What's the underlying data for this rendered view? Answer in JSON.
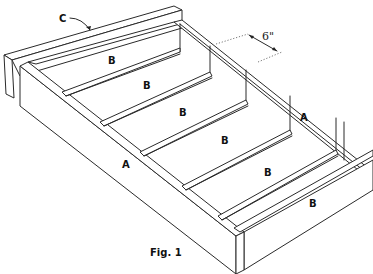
{
  "figure": {
    "caption": "Fig. 1"
  },
  "labels": {
    "c_top_rail": "C",
    "b_slot_1": "B",
    "b_slot_2": "B",
    "b_slot_3": "B",
    "b_slot_4": "B",
    "b_slot_5": "B",
    "b_front_side": "B",
    "a_right_end": "A",
    "a_left_side": "A"
  },
  "dimension": {
    "spacing": "6\""
  },
  "colors": {
    "line": "#2a2a2a",
    "background": "#ffffff"
  }
}
